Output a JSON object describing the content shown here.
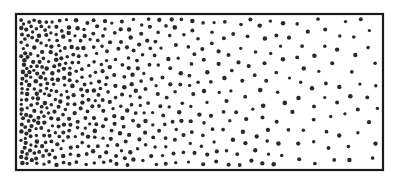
{
  "figure": {
    "frame": {
      "x": 16,
      "y": 14,
      "width": 367,
      "height": 156,
      "stroke": "#1a1a1a",
      "stroke_width": 2.2
    },
    "particles": {
      "color": "#2a2a2a",
      "radius_min": 1.6,
      "radius_max": 2.3,
      "density_left": 1.0,
      "density_right": 0.12,
      "total_count": 620,
      "seed": 7
    },
    "background": "#ffffff"
  }
}
